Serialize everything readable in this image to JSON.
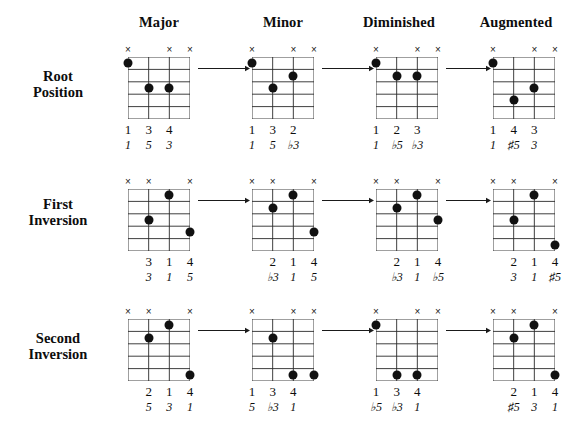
{
  "figure": {
    "grid_strings": 4,
    "grid_frets": 5,
    "mute_symbol": "×",
    "ink_color": "#111111",
    "background_color": "#ffffff"
  },
  "columns": [
    {
      "label": "Major"
    },
    {
      "label": "Minor"
    },
    {
      "label": "Diminished"
    },
    {
      "label": "Augmented"
    }
  ],
  "rows": [
    {
      "line1": "Root",
      "line2": "Position"
    },
    {
      "line1": "First",
      "line2": "Inversion"
    },
    {
      "line1": "Second",
      "line2": "Inversion"
    }
  ],
  "chart_data": {
    "type": "table",
    "xlabel": "Chord Quality",
    "ylabel": "Inversion",
    "categories": [
      "Major",
      "Minor",
      "Diminished",
      "Augmented"
    ],
    "series": [
      {
        "name": "Root Position"
      },
      {
        "name": "First Inversion"
      },
      {
        "name": "Second Inversion"
      }
    ],
    "legend": "Grid: 4 strings × 5 frets; × = muted string; filled circle = fretted note",
    "cells": [
      {
        "row": "Root Position",
        "column": "Major",
        "mutes": [
          1,
          3,
          4
        ],
        "dots": [
          {
            "string": 1,
            "fret": 1
          },
          {
            "string": 2,
            "fret": 3
          },
          {
            "string": 3,
            "fret": 3
          }
        ],
        "fingers": [
          {
            "string": 1,
            "text": "1"
          },
          {
            "string": 2,
            "text": "3"
          },
          {
            "string": 3,
            "text": "4"
          }
        ],
        "intervals": [
          {
            "string": 1,
            "text": "1"
          },
          {
            "string": 2,
            "text": "5"
          },
          {
            "string": 3,
            "text": "3"
          }
        ]
      },
      {
        "row": "Root Position",
        "column": "Minor",
        "mutes": [
          1,
          3,
          4
        ],
        "dots": [
          {
            "string": 1,
            "fret": 1
          },
          {
            "string": 2,
            "fret": 3
          },
          {
            "string": 3,
            "fret": 2
          }
        ],
        "fingers": [
          {
            "string": 1,
            "text": "1"
          },
          {
            "string": 2,
            "text": "3"
          },
          {
            "string": 3,
            "text": "2"
          }
        ],
        "intervals": [
          {
            "string": 1,
            "text": "1"
          },
          {
            "string": 2,
            "text": "5"
          },
          {
            "string": 3,
            "text": "♭3"
          }
        ]
      },
      {
        "row": "Root Position",
        "column": "Diminished",
        "mutes": [
          1,
          3,
          4
        ],
        "dots": [
          {
            "string": 1,
            "fret": 1
          },
          {
            "string": 2,
            "fret": 2
          },
          {
            "string": 3,
            "fret": 2
          }
        ],
        "fingers": [
          {
            "string": 1,
            "text": "1"
          },
          {
            "string": 2,
            "text": "2"
          },
          {
            "string": 3,
            "text": "3"
          }
        ],
        "intervals": [
          {
            "string": 1,
            "text": "1"
          },
          {
            "string": 2,
            "text": "♭5"
          },
          {
            "string": 3,
            "text": "♭3"
          }
        ]
      },
      {
        "row": "Root Position",
        "column": "Augmented",
        "mutes": [
          1,
          3,
          4
        ],
        "dots": [
          {
            "string": 1,
            "fret": 1
          },
          {
            "string": 2,
            "fret": 4
          },
          {
            "string": 3,
            "fret": 3
          }
        ],
        "fingers": [
          {
            "string": 1,
            "text": "1"
          },
          {
            "string": 2,
            "text": "4"
          },
          {
            "string": 3,
            "text": "3"
          }
        ],
        "intervals": [
          {
            "string": 1,
            "text": "1"
          },
          {
            "string": 2,
            "text": "♯5"
          },
          {
            "string": 3,
            "text": "3"
          }
        ]
      },
      {
        "row": "First Inversion",
        "column": "Major",
        "mutes": [
          1,
          2,
          4
        ],
        "dots": [
          {
            "string": 2,
            "fret": 3
          },
          {
            "string": 3,
            "fret": 1
          },
          {
            "string": 4,
            "fret": 4
          }
        ],
        "fingers": [
          {
            "string": 2,
            "text": "3"
          },
          {
            "string": 3,
            "text": "1"
          },
          {
            "string": 4,
            "text": "4"
          }
        ],
        "intervals": [
          {
            "string": 2,
            "text": "3"
          },
          {
            "string": 3,
            "text": "1"
          },
          {
            "string": 4,
            "text": "5"
          }
        ]
      },
      {
        "row": "First Inversion",
        "column": "Minor",
        "mutes": [
          1,
          2,
          4
        ],
        "dots": [
          {
            "string": 2,
            "fret": 2
          },
          {
            "string": 3,
            "fret": 1
          },
          {
            "string": 4,
            "fret": 4
          }
        ],
        "fingers": [
          {
            "string": 2,
            "text": "2"
          },
          {
            "string": 3,
            "text": "1"
          },
          {
            "string": 4,
            "text": "4"
          }
        ],
        "intervals": [
          {
            "string": 2,
            "text": "♭3"
          },
          {
            "string": 3,
            "text": "1"
          },
          {
            "string": 4,
            "text": "5"
          }
        ]
      },
      {
        "row": "First Inversion",
        "column": "Diminished",
        "mutes": [
          1,
          2,
          4
        ],
        "dots": [
          {
            "string": 2,
            "fret": 2
          },
          {
            "string": 3,
            "fret": 1
          },
          {
            "string": 4,
            "fret": 3
          }
        ],
        "fingers": [
          {
            "string": 2,
            "text": "2"
          },
          {
            "string": 3,
            "text": "1"
          },
          {
            "string": 4,
            "text": "4"
          }
        ],
        "intervals": [
          {
            "string": 2,
            "text": "♭3"
          },
          {
            "string": 3,
            "text": "1"
          },
          {
            "string": 4,
            "text": "♭5"
          }
        ]
      },
      {
        "row": "First Inversion",
        "column": "Augmented",
        "mutes": [
          1,
          2,
          4
        ],
        "dots": [
          {
            "string": 2,
            "fret": 3
          },
          {
            "string": 3,
            "fret": 1
          },
          {
            "string": 4,
            "fret": 5
          }
        ],
        "fingers": [
          {
            "string": 2,
            "text": "2"
          },
          {
            "string": 3,
            "text": "1"
          },
          {
            "string": 4,
            "text": "4"
          }
        ],
        "intervals": [
          {
            "string": 2,
            "text": "3"
          },
          {
            "string": 3,
            "text": "1"
          },
          {
            "string": 4,
            "text": "♯5"
          }
        ]
      },
      {
        "row": "Second Inversion",
        "column": "Major",
        "mutes": [
          1,
          2,
          4
        ],
        "dots": [
          {
            "string": 2,
            "fret": 2
          },
          {
            "string": 3,
            "fret": 1
          },
          {
            "string": 4,
            "fret": 5
          }
        ],
        "fingers": [
          {
            "string": 2,
            "text": "2"
          },
          {
            "string": 3,
            "text": "1"
          },
          {
            "string": 4,
            "text": "4"
          }
        ],
        "intervals": [
          {
            "string": 2,
            "text": "5"
          },
          {
            "string": 3,
            "text": "3"
          },
          {
            "string": 4,
            "text": "1"
          }
        ]
      },
      {
        "row": "Second Inversion",
        "column": "Minor",
        "mutes": [
          1,
          3,
          4
        ],
        "dots": [
          {
            "string": 2,
            "fret": 2
          },
          {
            "string": 3,
            "fret": 5
          },
          {
            "string": 4,
            "fret": 5
          }
        ],
        "fingers": [
          {
            "string": 1,
            "text": "1"
          },
          {
            "string": 2,
            "text": "3"
          },
          {
            "string": 3,
            "text": "4"
          }
        ],
        "intervals": [
          {
            "string": 1,
            "text": "5"
          },
          {
            "string": 2,
            "text": "♭3"
          },
          {
            "string": 3,
            "text": "1"
          }
        ]
      },
      {
        "row": "Second Inversion",
        "column": "Diminished",
        "mutes": [
          1,
          3,
          4
        ],
        "dots": [
          {
            "string": 1,
            "fret": 1
          },
          {
            "string": 2,
            "fret": 5
          },
          {
            "string": 3,
            "fret": 5
          }
        ],
        "fingers": [
          {
            "string": 1,
            "text": "1"
          },
          {
            "string": 2,
            "text": "3"
          },
          {
            "string": 3,
            "text": "4"
          }
        ],
        "intervals": [
          {
            "string": 1,
            "text": "♭5"
          },
          {
            "string": 2,
            "text": "♭3"
          },
          {
            "string": 3,
            "text": "1"
          }
        ]
      },
      {
        "row": "Second Inversion",
        "column": "Augmented",
        "mutes": [
          1,
          2,
          4
        ],
        "dots": [
          {
            "string": 2,
            "fret": 2
          },
          {
            "string": 3,
            "fret": 1
          },
          {
            "string": 4,
            "fret": 5
          }
        ],
        "fingers": [
          {
            "string": 2,
            "text": "2"
          },
          {
            "string": 3,
            "text": "1"
          },
          {
            "string": 4,
            "text": "4"
          }
        ],
        "intervals": [
          {
            "string": 2,
            "text": "♯5"
          },
          {
            "string": 3,
            "text": "3"
          },
          {
            "string": 4,
            "text": "1"
          }
        ]
      }
    ],
    "arrows": [
      {
        "row": "Root Position",
        "from": "Major",
        "to": "Minor"
      },
      {
        "row": "Root Position",
        "from": "Minor",
        "to": "Diminished"
      },
      {
        "row": "Root Position",
        "from": "Diminished",
        "to": "Augmented"
      },
      {
        "row": "First Inversion",
        "from": "Major",
        "to": "Minor"
      },
      {
        "row": "First Inversion",
        "from": "Minor",
        "to": "Diminished"
      },
      {
        "row": "First Inversion",
        "from": "Diminished",
        "to": "Augmented"
      },
      {
        "row": "Second Inversion",
        "from": "Major",
        "to": "Minor"
      },
      {
        "row": "Second Inversion",
        "from": "Minor",
        "to": "Diminished"
      },
      {
        "row": "Second Inversion",
        "from": "Diminished",
        "to": "Augmented"
      }
    ]
  }
}
